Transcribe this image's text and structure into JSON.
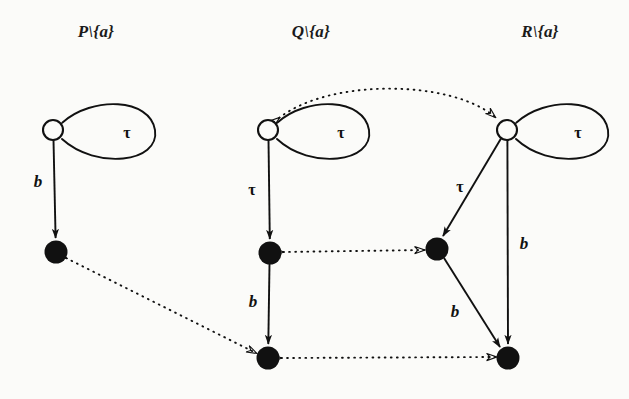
{
  "figure": {
    "type": "labelled-transition-system-diagram",
    "background_color": "#fbfbf9",
    "stroke_color": "#111111",
    "width": 629,
    "height": 399
  },
  "columns": [
    {
      "id": "P",
      "title": "P\\{a}",
      "x": 96,
      "y": 22
    },
    {
      "id": "Q",
      "title": "Q\\{a}",
      "x": 311,
      "y": 22
    },
    {
      "id": "R",
      "title": "R\\{a}",
      "x": 540,
      "y": 22
    }
  ],
  "nodes": [
    {
      "id": "p0",
      "kind": "open",
      "cx": 53,
      "cy": 130,
      "r": 10
    },
    {
      "id": "p1",
      "kind": "filled",
      "cx": 56,
      "cy": 252,
      "r": 11
    },
    {
      "id": "q0",
      "kind": "open",
      "cx": 268,
      "cy": 130,
      "r": 10
    },
    {
      "id": "q1",
      "kind": "filled",
      "cx": 270,
      "cy": 253,
      "r": 11
    },
    {
      "id": "q2",
      "kind": "filled",
      "cx": 268,
      "cy": 358,
      "r": 11
    },
    {
      "id": "r0",
      "kind": "open",
      "cx": 507,
      "cy": 130,
      "r": 10
    },
    {
      "id": "r1",
      "kind": "filled",
      "cx": 437,
      "cy": 249,
      "r": 11
    },
    {
      "id": "r2",
      "kind": "filled",
      "cx": 508,
      "cy": 358,
      "r": 11
    }
  ],
  "transitions": [
    {
      "id": "p0-loop",
      "from": "p0",
      "to": "p0",
      "label": "τ",
      "style": "solid",
      "label_x": 127,
      "label_y": 133
    },
    {
      "id": "p0-p1",
      "from": "p0",
      "to": "p1",
      "label": "b",
      "style": "solid",
      "label_x": 38,
      "label_y": 182
    },
    {
      "id": "q0-loop",
      "from": "q0",
      "to": "q0",
      "label": "τ",
      "style": "solid",
      "label_x": 341,
      "label_y": 133
    },
    {
      "id": "q0-q1",
      "from": "q0",
      "to": "q1",
      "label": "τ",
      "style": "solid",
      "label_x": 252,
      "label_y": 190
    },
    {
      "id": "q1-q2",
      "from": "q1",
      "to": "q2",
      "label": "b",
      "style": "solid",
      "label_x": 253,
      "label_y": 302
    },
    {
      "id": "r0-loop",
      "from": "r0",
      "to": "r0",
      "label": "τ",
      "style": "solid",
      "label_x": 578,
      "label_y": 133
    },
    {
      "id": "r0-r1",
      "from": "r0",
      "to": "r1",
      "label": "τ",
      "style": "solid",
      "label_x": 460,
      "label_y": 187
    },
    {
      "id": "r0-r2",
      "from": "r0",
      "to": "r2",
      "label": "b",
      "style": "solid",
      "label_x": 524,
      "label_y": 244
    },
    {
      "id": "r1-r2",
      "from": "r1",
      "to": "r2",
      "label": "b",
      "style": "solid",
      "label_x": 455,
      "label_y": 312
    }
  ],
  "relations": [
    {
      "id": "q0-r0",
      "from": "q0",
      "to": "r0",
      "style": "dotted",
      "arrowheads": "both",
      "shape": "arc"
    },
    {
      "id": "q1-r1",
      "from": "q1",
      "to": "r1",
      "style": "dotted",
      "arrowheads": "both",
      "shape": "straight"
    },
    {
      "id": "p1-q2",
      "from": "p1",
      "to": "q2",
      "style": "dotted",
      "arrowheads": "both",
      "shape": "straight"
    },
    {
      "id": "q2-r2",
      "from": "q2",
      "to": "r2",
      "style": "dotted",
      "arrowheads": "both",
      "shape": "straight"
    }
  ]
}
